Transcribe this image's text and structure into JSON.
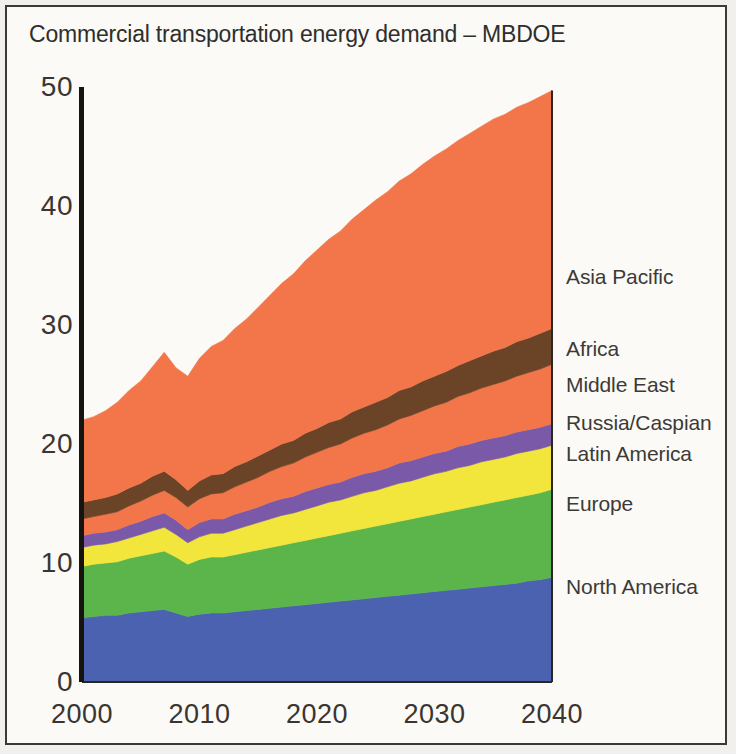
{
  "chart_data": {
    "type": "area",
    "stacked": true,
    "title": "Commercial transportation energy demand – MBDOE",
    "xlabel": "",
    "ylabel": "MBDOE",
    "xlim": [
      2000,
      2040
    ],
    "ylim": [
      0,
      50
    ],
    "yticks": [
      "0",
      "10",
      "20",
      "30",
      "40",
      "50"
    ],
    "ytick_values": [
      0,
      10,
      20,
      30,
      40,
      50
    ],
    "xticks": [
      "2000",
      "2010",
      "2020",
      "2030",
      "2040"
    ],
    "xtick_values": [
      2000,
      2010,
      2020,
      2030,
      2040
    ],
    "grid": false,
    "legend_position": "right-inline",
    "x": [
      2000,
      2001,
      2002,
      2003,
      2004,
      2005,
      2006,
      2007,
      2008,
      2009,
      2010,
      2011,
      2012,
      2013,
      2014,
      2015,
      2016,
      2017,
      2018,
      2019,
      2020,
      2021,
      2022,
      2023,
      2024,
      2025,
      2026,
      2027,
      2028,
      2029,
      2030,
      2031,
      2032,
      2033,
      2034,
      2035,
      2036,
      2037,
      2038,
      2039,
      2040
    ],
    "series": [
      {
        "name": "North America",
        "color": "#4a62b0",
        "values": [
          5.4,
          5.5,
          5.6,
          5.6,
          5.8,
          5.9,
          6.0,
          6.1,
          5.8,
          5.5,
          5.7,
          5.8,
          5.8,
          5.9,
          6.0,
          6.1,
          6.2,
          6.3,
          6.4,
          6.5,
          6.6,
          6.7,
          6.8,
          6.9,
          7.0,
          7.1,
          7.2,
          7.3,
          7.4,
          7.5,
          7.6,
          7.7,
          7.8,
          7.9,
          8.0,
          8.1,
          8.2,
          8.3,
          8.5,
          8.6,
          8.8
        ]
      },
      {
        "name": "Europe",
        "color": "#5cb54a",
        "values": [
          4.3,
          4.4,
          4.4,
          4.5,
          4.6,
          4.7,
          4.8,
          4.9,
          4.7,
          4.4,
          4.6,
          4.7,
          4.7,
          4.8,
          4.9,
          5.0,
          5.1,
          5.2,
          5.3,
          5.4,
          5.5,
          5.6,
          5.7,
          5.8,
          5.9,
          6.0,
          6.1,
          6.2,
          6.3,
          6.4,
          6.5,
          6.6,
          6.7,
          6.8,
          6.9,
          7.0,
          7.1,
          7.2,
          7.2,
          7.3,
          7.4
        ]
      },
      {
        "name": "Latin America",
        "color": "#f2e63c",
        "values": [
          1.6,
          1.6,
          1.6,
          1.7,
          1.7,
          1.8,
          1.9,
          2.0,
          1.9,
          1.8,
          1.9,
          2.0,
          2.0,
          2.1,
          2.2,
          2.3,
          2.4,
          2.5,
          2.5,
          2.6,
          2.7,
          2.8,
          2.8,
          2.9,
          3.0,
          3.0,
          3.1,
          3.2,
          3.2,
          3.3,
          3.4,
          3.4,
          3.5,
          3.5,
          3.6,
          3.6,
          3.6,
          3.7,
          3.7,
          3.7,
          3.7
        ]
      },
      {
        "name": "Russia/Caspian",
        "color": "#7a5aa8",
        "values": [
          1.0,
          1.0,
          1.0,
          1.0,
          1.1,
          1.1,
          1.2,
          1.2,
          1.2,
          1.1,
          1.2,
          1.2,
          1.2,
          1.3,
          1.3,
          1.3,
          1.4,
          1.4,
          1.4,
          1.5,
          1.5,
          1.5,
          1.5,
          1.6,
          1.6,
          1.6,
          1.6,
          1.7,
          1.7,
          1.7,
          1.7,
          1.7,
          1.8,
          1.8,
          1.8,
          1.8,
          1.8,
          1.8,
          1.8,
          1.8,
          1.8
        ]
      },
      {
        "name": "Middle East",
        "color": "#f2764a",
        "values": [
          1.4,
          1.4,
          1.5,
          1.5,
          1.6,
          1.7,
          1.8,
          1.9,
          1.9,
          1.9,
          2.0,
          2.1,
          2.2,
          2.3,
          2.4,
          2.5,
          2.6,
          2.7,
          2.8,
          2.9,
          3.0,
          3.1,
          3.2,
          3.3,
          3.4,
          3.5,
          3.6,
          3.7,
          3.8,
          3.9,
          4.0,
          4.1,
          4.2,
          4.3,
          4.4,
          4.5,
          4.6,
          4.7,
          4.8,
          4.9,
          5.0
        ]
      },
      {
        "name": "Africa",
        "color": "#6b4326",
        "values": [
          1.4,
          1.4,
          1.4,
          1.5,
          1.5,
          1.5,
          1.6,
          1.6,
          1.5,
          1.4,
          1.5,
          1.6,
          1.6,
          1.7,
          1.7,
          1.8,
          1.8,
          1.9,
          1.9,
          2.0,
          2.0,
          2.1,
          2.1,
          2.2,
          2.2,
          2.3,
          2.3,
          2.4,
          2.4,
          2.5,
          2.5,
          2.6,
          2.6,
          2.7,
          2.7,
          2.8,
          2.8,
          2.9,
          2.9,
          3.0,
          3.0
        ]
      },
      {
        "name": "Asia Pacific",
        "color": "#f2764a",
        "values": [
          6.9,
          7.0,
          7.3,
          7.7,
          8.2,
          8.6,
          9.2,
          10.0,
          9.4,
          9.6,
          10.3,
          10.8,
          11.2,
          11.6,
          12.0,
          12.5,
          13.0,
          13.5,
          14.0,
          14.5,
          15.0,
          15.4,
          15.8,
          16.2,
          16.6,
          17.0,
          17.3,
          17.6,
          17.9,
          18.2,
          18.5,
          18.7,
          18.9,
          19.1,
          19.3,
          19.5,
          19.6,
          19.7,
          19.8,
          19.9,
          20.0
        ]
      }
    ],
    "series_label_positions": [
      {
        "name": "Asia Pacific",
        "y_value": 34.0
      },
      {
        "name": "Africa",
        "y_value": 28.0
      },
      {
        "name": "Middle East",
        "y_value": 25.0
      },
      {
        "name": "Russia/Caspian",
        "y_value": 21.8
      },
      {
        "name": "Latin America",
        "y_value": 19.2
      },
      {
        "name": "Europe",
        "y_value": 15.0
      },
      {
        "name": "North America",
        "y_value": 8.0
      }
    ]
  }
}
